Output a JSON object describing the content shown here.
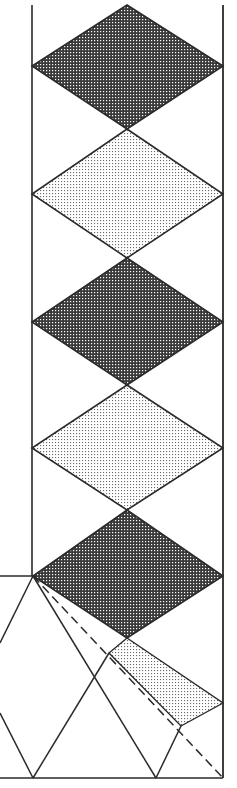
{
  "diagram": {
    "width": 237,
    "height": 788,
    "colors": {
      "line": "#2a2a2a",
      "dark_fill_bg": "#4a4a4a",
      "dark_fill_dot": "#ffffff",
      "light_fill_bg": "#ffffff",
      "light_fill_dot": "#555555",
      "background": "#ffffff"
    },
    "strip": {
      "left_x": 32,
      "right_x": 223,
      "top_y": 5,
      "bottom_y": 778
    },
    "rhombi": [
      {
        "id": "r1",
        "fill": "dark",
        "top": [
          127,
          5
        ],
        "left": [
          32,
          66
        ],
        "right": [
          223,
          66
        ],
        "bottom": [
          127,
          129
        ]
      },
      {
        "id": "r2",
        "fill": "light",
        "top": [
          127,
          129
        ],
        "left": [
          32,
          194
        ],
        "right": [
          223,
          194
        ],
        "bottom": [
          127,
          258
        ]
      },
      {
        "id": "r3",
        "fill": "dark",
        "top": [
          127,
          258
        ],
        "left": [
          32,
          322
        ],
        "right": [
          223,
          322
        ],
        "bottom": [
          127,
          385
        ]
      },
      {
        "id": "r4",
        "fill": "light",
        "top": [
          127,
          385
        ],
        "left": [
          32,
          448
        ],
        "right": [
          223,
          448
        ],
        "bottom": [
          127,
          510
        ]
      },
      {
        "id": "r5",
        "fill": "dark",
        "top": [
          127,
          510
        ],
        "left": [
          33,
          576
        ],
        "right": [
          223,
          576
        ],
        "bottom": [
          127,
          638
        ]
      }
    ],
    "light_parallelogram": {
      "points": [
        [
          127,
          638
        ],
        [
          223,
          703
        ],
        [
          181,
          726
        ],
        [
          109,
          653
        ]
      ]
    },
    "lines": [
      {
        "id": "ledge",
        "from": [
          0,
          576
        ],
        "to": [
          33,
          576
        ],
        "style": "solid"
      },
      {
        "id": "base",
        "from": [
          0,
          778
        ],
        "to": [
          223,
          778
        ],
        "style": "solid"
      },
      {
        "id": "fan-left-down",
        "from": [
          33,
          576
        ],
        "to": [
          0,
          643
        ],
        "style": "solid"
      },
      {
        "id": "fan-left-up-from-base",
        "from": [
          0,
          713
        ],
        "to": [
          33,
          778
        ],
        "style": "solid"
      },
      {
        "id": "v-base-left",
        "from": [
          33,
          778
        ],
        "to": [
          109,
          653
        ],
        "style": "solid"
      },
      {
        "id": "fan-steep",
        "from": [
          33,
          576
        ],
        "to": [
          156,
          778
        ],
        "style": "solid"
      },
      {
        "id": "fan-dashed",
        "from": [
          33,
          576
        ],
        "to": [
          223,
          778
        ],
        "style": "dashed"
      },
      {
        "id": "v-base-right",
        "from": [
          156,
          778
        ],
        "to": [
          181,
          726
        ],
        "style": "solid"
      }
    ]
  }
}
